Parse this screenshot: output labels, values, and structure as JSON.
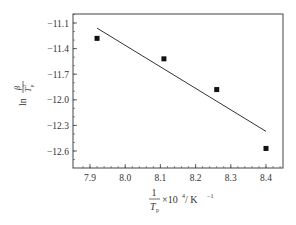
{
  "chart_data": {
    "type": "scatter",
    "title": "",
    "xlabel": "1/Tp ×10^4 / K^-1",
    "ylabel": "ln (β/Tp^2)",
    "xlabel_parts": {
      "num": "1",
      "den": "T",
      "den_sub": "p",
      "rest": "×10",
      "exp": "4",
      "unit": " / K",
      "unit_exp": "−1"
    },
    "ylabel_parts": {
      "ln": "ln",
      "num": "β",
      "den": "T",
      "den_sub": "p",
      "den_exp": "2"
    },
    "xlim": [
      7.87,
      8.45
    ],
    "ylim": [
      -12.78,
      -10.98
    ],
    "xticks": [
      7.9,
      8.0,
      8.1,
      8.2,
      8.3,
      8.4
    ],
    "xtick_labels": [
      "7.9",
      "8.0",
      "8.1",
      "8.2",
      "8.3",
      "8.4"
    ],
    "yticks": [
      -11.1,
      -11.4,
      -11.7,
      -12.0,
      -12.3,
      -12.6
    ],
    "ytick_labels": [
      "−11.1",
      "−11.4",
      "−11.7",
      "−12.0",
      "−12.3",
      "−12.6"
    ],
    "grid": false,
    "legend": null,
    "series": [
      {
        "name": "data",
        "marker": "square",
        "x": [
          7.92,
          8.11,
          8.26,
          8.4
        ],
        "y": [
          -11.28,
          -11.52,
          -11.88,
          -12.57
        ]
      },
      {
        "name": "linear fit",
        "style": "line",
        "x": [
          7.92,
          8.4
        ],
        "y": [
          -11.16,
          -12.37
        ]
      }
    ]
  }
}
